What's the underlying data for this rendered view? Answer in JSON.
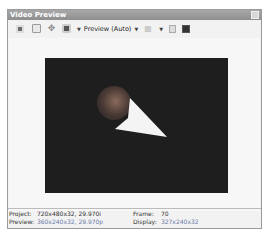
{
  "window": {
    "title": "Video Preview"
  },
  "toolbar": {
    "preview_mode_label": "Preview (Auto)",
    "icons": [
      "split-screen-icon",
      "external-monitor-icon",
      "overlay-icon",
      "preview-quality-icon",
      "grid-icon",
      "copy-snapshot-icon",
      "save-snapshot-icon"
    ]
  },
  "status": {
    "project_label": "Project:",
    "project_value": "720x480x32, 29.970i",
    "preview_label": "Preview:",
    "preview_value": "360x240x32, 29.970p",
    "frame_label": "Frame:",
    "frame_value": "70",
    "display_label": "Display:",
    "display_value": "327x240x32"
  }
}
